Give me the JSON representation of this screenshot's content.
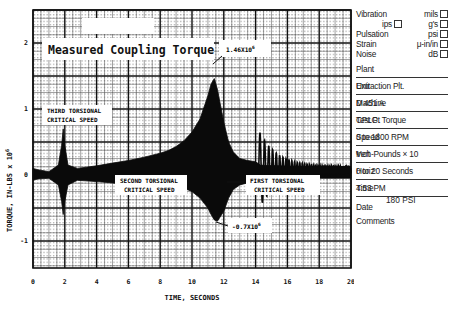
{
  "chart_data": {
    "type": "line",
    "title": "Measured Coupling Torque",
    "xlabel": "TIME, SECONDS",
    "ylabel": "TORQUE, IN-LBS × 10^6",
    "ylabel_text": "TORQUE, IN-LBS x 10",
    "ylabel_exp": "6",
    "xlim": [
      0,
      20
    ],
    "ylim": [
      -1.5,
      2.5
    ],
    "x_ticks": [
      0,
      2,
      4,
      6,
      8,
      10,
      12,
      14,
      16,
      18,
      20
    ],
    "x_tick_labels": [
      "0",
      "2",
      "4",
      "6",
      "8",
      "10",
      "12",
      "14",
      "16",
      "18",
      "20"
    ],
    "y_ticks": [
      2,
      1,
      0,
      -1
    ],
    "y_tick_labels": [
      "2",
      "1",
      "0",
      "-1"
    ],
    "grid": true,
    "legend": "none",
    "annotations": [
      {
        "text": "THIRD TORSIONAL",
        "text2": "CRITICAL SPEED",
        "x": 1.9
      },
      {
        "text": "SECOND TORSIONAL",
        "text2": "CRITICAL SPEED",
        "x": 9.3
      },
      {
        "text": "FIRST TORSIONAL",
        "text2": "CRITICAL SPEED",
        "x": 14.0
      },
      {
        "text": "1.46X10",
        "exp": "6",
        "x": 11.3,
        "y": 1.46
      },
      {
        "text": "-0.7X10",
        "exp": "6",
        "x": 11.6,
        "y": -0.7
      }
    ],
    "envelope": {
      "x": [
        0.0,
        0.3,
        1.0,
        1.6,
        1.8,
        1.9,
        2.0,
        2.2,
        2.8,
        4.0,
        5.0,
        6.0,
        7.0,
        8.0,
        8.5,
        9.0,
        9.5,
        10.0,
        10.5,
        11.0,
        11.2,
        11.4,
        11.6,
        12.0,
        12.3,
        12.6,
        13.0,
        13.5,
        14.0,
        14.3,
        20.0
      ],
      "upper": [
        0.1,
        0.08,
        0.05,
        0.15,
        0.45,
        0.7,
        0.45,
        0.15,
        0.1,
        0.14,
        0.18,
        0.22,
        0.27,
        0.33,
        0.37,
        0.43,
        0.52,
        0.65,
        0.85,
        1.2,
        1.38,
        1.46,
        1.3,
        0.8,
        0.5,
        0.35,
        0.25,
        0.22,
        0.2,
        0.15,
        0.1
      ],
      "lower": [
        -0.08,
        -0.06,
        -0.05,
        -0.15,
        -0.4,
        -0.6,
        -0.4,
        -0.15,
        -0.08,
        -0.1,
        -0.12,
        -0.15,
        -0.17,
        -0.2,
        -0.25,
        -0.3,
        -0.2,
        -0.25,
        -0.35,
        -0.5,
        -0.6,
        -0.68,
        -0.7,
        -0.55,
        -0.35,
        -0.22,
        -0.15,
        -0.12,
        -0.1,
        -0.05,
        -0.05
      ]
    },
    "decay_oscillation": {
      "start_s": 14.2,
      "end_s": 20,
      "description": "decaying ringing from ~0.55 amplitude at 14.5s to ~0.05 at 20s"
    }
  },
  "form": {
    "checkboxes": {
      "vibration": "Vibration",
      "mils": "mils",
      "ips": "ips",
      "gs": "g's",
      "pulsation": "Pulsation",
      "psi": "psi",
      "strain": "Strain",
      "uinin": "μ-in/in",
      "noise": "Noise",
      "db": "dB"
    },
    "fields": [
      {
        "label": "Plant",
        "value": ""
      },
      {
        "label": "Unit",
        "value": "Extraction Plt."
      },
      {
        "label": "Machine",
        "value": "D 451 A"
      },
      {
        "label": "Test Pt",
        "value": "CPLG. Torque"
      },
      {
        "label": "Speed",
        "value": "0 to 1800 RPM"
      },
      {
        "label": "Vert",
        "value": "Inch-Pounds × 10",
        "exp": "6"
      },
      {
        "label": "Horiz",
        "value": "0 to 20 Seconds"
      },
      {
        "label": "Time",
        "value": "4:53 PM"
      }
    ],
    "date_label": "Date",
    "comments_label": "Comments",
    "comments_value": "180 PSI"
  }
}
